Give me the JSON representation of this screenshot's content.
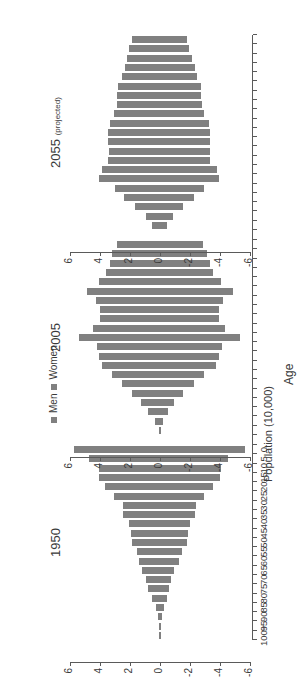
{
  "figure": {
    "legend": {
      "items": [
        {
          "label": "Men",
          "color": "#808080",
          "marker": "square-marker"
        },
        {
          "label": "Women",
          "color": "#808080",
          "marker": "square-marker"
        }
      ]
    },
    "age_axis": {
      "title": "Age",
      "ticks": [
        "100+",
        "95",
        "90",
        "85",
        "80",
        "75",
        "70",
        "65",
        "60",
        "55",
        "50",
        "45",
        "40",
        "35",
        "30",
        "25",
        "20",
        "15",
        "10",
        "5",
        "0"
      ]
    },
    "population_axis": {
      "title": "Population (10,000)",
      "ticks": [
        "-6",
        "-4",
        "-2",
        "0",
        "2",
        "4",
        "6"
      ],
      "min": -6,
      "max": 6
    },
    "panels": [
      {
        "id": "1950",
        "title": "1950",
        "subtitle": ""
      },
      {
        "id": "2005",
        "title": "2005",
        "subtitle": ""
      },
      {
        "id": "2055",
        "title": "2055",
        "subtitle": "(projected)"
      }
    ]
  },
  "chart_data": {
    "type": "bar",
    "xlabel": "Age",
    "ylabel": "Population (10,000)",
    "ylim": [
      -6,
      6
    ],
    "grid": false,
    "legend_position": "top-center",
    "categories": [
      "100+",
      "95",
      "90",
      "85",
      "80",
      "75",
      "70",
      "65",
      "60",
      "55",
      "50",
      "45",
      "40",
      "35",
      "30",
      "25",
      "20",
      "15",
      "10",
      "5",
      "0"
    ],
    "panels": [
      {
        "name": "1950",
        "series": [
          {
            "name": "Men",
            "values": [
              0.02,
              0.05,
              0.12,
              0.28,
              0.45,
              0.62,
              0.7,
              0.95,
              1.25,
              1.45,
              1.8,
              1.85,
              2.0,
              2.35,
              2.4,
              2.9,
              3.55,
              4.0,
              4.05,
              4.55,
              5.65
            ]
          },
          {
            "name": "Women",
            "values": [
              0.02,
              0.05,
              0.12,
              0.28,
              0.52,
              0.78,
              0.95,
              1.2,
              1.4,
              1.55,
              1.85,
              1.95,
              2.1,
              2.45,
              2.5,
              3.05,
              3.7,
              4.1,
              4.1,
              4.75,
              5.75
            ]
          }
        ]
      },
      {
        "name": "2005",
        "series": [
          {
            "name": "Men",
            "values": [
              0.05,
              0.2,
              0.55,
              0.95,
              1.55,
              2.25,
              2.95,
              3.7,
              3.95,
              4.15,
              5.3,
              4.35,
              3.95,
              3.95,
              4.2,
              4.85,
              4.05,
              3.55,
              3.3,
              3.15,
              2.85
            ]
          },
          {
            "name": "Women",
            "values": [
              0.1,
              0.35,
              0.8,
              1.25,
              1.9,
              2.55,
              3.2,
              3.85,
              4.05,
              4.2,
              5.4,
              4.45,
              4.0,
              4.0,
              4.25,
              4.9,
              4.1,
              3.6,
              3.35,
              3.2,
              2.9
            ]
          }
        ]
      },
      {
        "name": "2055",
        "series": [
          {
            "name": "Men",
            "values": [
              0.45,
              0.85,
              1.55,
              2.25,
              2.9,
              3.95,
              3.8,
              3.35,
              3.3,
              3.35,
              3.35,
              3.25,
              2.95,
              2.8,
              2.75,
              2.7,
              2.45,
              2.3,
              2.1,
              1.95,
              1.8
            ]
          },
          {
            "name": "Women",
            "values": [
              0.55,
              0.95,
              1.7,
              2.4,
              3.0,
              4.05,
              3.9,
              3.45,
              3.4,
              3.45,
              3.45,
              3.35,
              3.05,
              2.9,
              2.85,
              2.8,
              2.55,
              2.35,
              2.2,
              2.05,
              1.9
            ]
          }
        ]
      }
    ]
  }
}
